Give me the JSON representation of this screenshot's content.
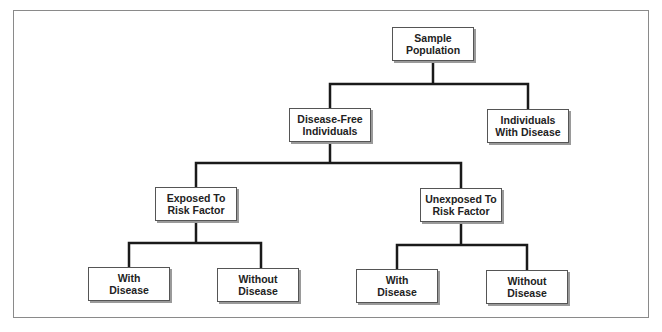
{
  "diagram": {
    "type": "tree",
    "nodes": [
      {
        "id": "sample",
        "label": "Sample Population",
        "lines": [
          "Sample",
          "Population"
        ]
      },
      {
        "id": "disease_free",
        "label": "Disease-Free Individuals",
        "lines": [
          "Disease-Free",
          "Individuals"
        ]
      },
      {
        "id": "with_disease_top",
        "label": "Individuals With Disease",
        "lines": [
          "Individuals",
          "With Disease"
        ]
      },
      {
        "id": "exposed",
        "label": "Exposed To Risk Factor",
        "lines": [
          "Exposed To",
          "Risk Factor"
        ]
      },
      {
        "id": "unexposed",
        "label": "Unexposed To Risk Factor",
        "lines": [
          "Unexposed To",
          "Risk Factor"
        ]
      },
      {
        "id": "exposed_with",
        "label": "With Disease",
        "lines": [
          "With",
          "Disease"
        ]
      },
      {
        "id": "exposed_without",
        "label": "Without Disease",
        "lines": [
          "Without",
          "Disease"
        ]
      },
      {
        "id": "unexposed_with",
        "label": "With Disease",
        "lines": [
          "With",
          "Disease"
        ]
      },
      {
        "id": "unexposed_without",
        "label": "Without Disease",
        "lines": [
          "Without",
          "Disease"
        ]
      }
    ],
    "edges": [
      [
        "sample",
        "disease_free"
      ],
      [
        "sample",
        "with_disease_top"
      ],
      [
        "disease_free",
        "exposed"
      ],
      [
        "disease_free",
        "unexposed"
      ],
      [
        "exposed",
        "exposed_with"
      ],
      [
        "exposed",
        "exposed_without"
      ],
      [
        "unexposed",
        "unexposed_with"
      ],
      [
        "unexposed",
        "unexposed_without"
      ]
    ]
  }
}
